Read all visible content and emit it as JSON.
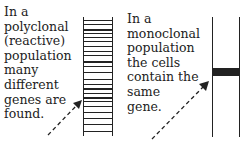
{
  "left_panel": {
    "lines": [
      "In a",
      "polyclonal",
      "(reactive)",
      "population",
      "many",
      "different",
      "genes are",
      "found."
    ],
    "band_positions": [
      20,
      24,
      29,
      33,
      37,
      41,
      46,
      51,
      55,
      61,
      66,
      72,
      79,
      84,
      88,
      93,
      97,
      101,
      106,
      112,
      118,
      124,
      131
    ],
    "band_thick": [
      1,
      1,
      2,
      1,
      1,
      1,
      1,
      1,
      1,
      2,
      1,
      1,
      1,
      1,
      2,
      1,
      2,
      1,
      1,
      1,
      1,
      1,
      1
    ]
  },
  "right_panel": {
    "lines": [
      "In a",
      "monoclonal",
      "population",
      "the cells",
      "contain the",
      "same",
      "gene."
    ],
    "band_top": 68,
    "band_height": 8
  }
}
